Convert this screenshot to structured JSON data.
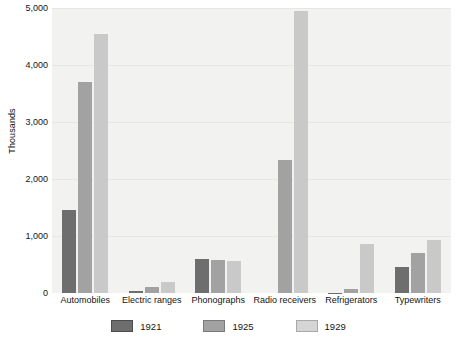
{
  "chart_data": {
    "type": "bar",
    "title": "",
    "xlabel": "",
    "ylabel": "Thousands",
    "ylim": [
      0,
      5000
    ],
    "ytick_labels": [
      "0",
      "1,000",
      "2,000",
      "3,000",
      "4,000",
      "5,000"
    ],
    "ytick_values": [
      0,
      1000,
      2000,
      3000,
      4000,
      5000
    ],
    "grid": true,
    "legend_position": "bottom",
    "categories": [
      "Automobiles",
      "Electric ranges",
      "Phonographs",
      "Radio receivers",
      "Refrigerators",
      "Typewriters"
    ],
    "series": [
      {
        "name": "1921",
        "color": "#6e6e6e",
        "values": [
          1460,
          30,
          600,
          0,
          5,
          450
        ]
      },
      {
        "name": "1925",
        "color": "#a2a2a2",
        "values": [
          3700,
          100,
          580,
          2340,
          75,
          700
        ]
      },
      {
        "name": "1929",
        "color": "#c9c9c9",
        "values": [
          4550,
          200,
          570,
          4950,
          860,
          930
        ]
      }
    ]
  },
  "legend": {
    "entries": [
      {
        "label": "1921"
      },
      {
        "label": "1925"
      },
      {
        "label": "1929"
      }
    ]
  }
}
